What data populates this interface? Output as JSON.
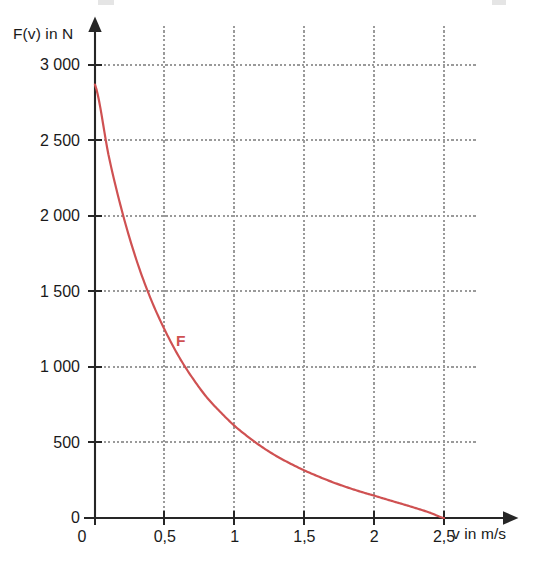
{
  "chart_data": {
    "type": "line",
    "title": "",
    "xlabel": "v in m/s",
    "ylabel": "F(v) in N",
    "xlim": [
      0,
      2.65
    ],
    "ylim": [
      0,
      3150
    ],
    "grid": true,
    "legend": "none",
    "xticks": [
      0,
      0.5,
      1,
      1.5,
      2,
      2.5
    ],
    "xtick_labels": [
      "0",
      "0,5",
      "1",
      "1,5",
      "2",
      "2,5"
    ],
    "yticks": [
      0,
      500,
      1000,
      1500,
      2000,
      2500,
      3000
    ],
    "ytick_labels": [
      "0",
      "500",
      "1 000",
      "1 500",
      "2 000",
      "2 500",
      "3 000"
    ],
    "series": [
      {
        "name": "F",
        "color": "#cf5152",
        "annotation": "F",
        "annotation_x": 0.62,
        "annotation_y": 1180,
        "x": [
          0,
          0.1,
          0.2,
          0.3,
          0.4,
          0.5,
          0.6,
          0.7,
          0.8,
          0.9,
          1.0,
          1.1,
          1.2,
          1.3,
          1.4,
          1.5,
          1.6,
          1.7,
          1.8,
          1.9,
          2.0,
          2.1,
          2.2,
          2.3,
          2.4,
          2.5
        ],
        "y": [
          2870,
          2390,
          2010,
          1700,
          1450,
          1245,
          1070,
          925,
          800,
          700,
          610,
          535,
          468,
          410,
          360,
          315,
          275,
          238,
          205,
          175,
          148,
          120,
          93,
          65,
          35,
          0
        ]
      }
    ]
  },
  "labels": {
    "y_axis_title": "F(v) in N",
    "x_axis_title": "v in m/s",
    "curve_label": "F"
  },
  "colors": {
    "curve": "#cf5152",
    "axis": "#262626",
    "grid": "#9a9a9a",
    "text": "#1a1a1a",
    "background": "#ffffff"
  }
}
